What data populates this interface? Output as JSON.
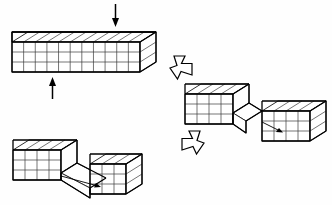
{
  "figure": {
    "background_color": "#fefefe",
    "line_color": "#000000",
    "face_color": "#ffffff",
    "grid_color": "#3a3a3a"
  },
  "shapes": [
    {
      "id": "straight-bar",
      "label": "straight-cube-bar",
      "position": "top-left",
      "front_columns": 11,
      "front_rows": 3,
      "top_columns": 11,
      "top_rows": 1,
      "side_rows": 3,
      "side_columns": 1,
      "description": "Long straight rectangular bar of unit cubes, 11 long x 3 tall x 1 deep"
    },
    {
      "id": "stepped-bar-small",
      "label": "stepped-cube-bar-small-offset",
      "position": "middle-right",
      "left_segment_columns": 4,
      "left_segment_rows": 3,
      "right_segment_columns": 4,
      "right_segment_rows": 3,
      "step_direction": "down-right",
      "description": "Bar folded once so the right half steps down by a small offset"
    },
    {
      "id": "stepped-bar-large",
      "label": "stepped-cube-bar-large-offset",
      "position": "bottom-left",
      "left_segment_columns": 4,
      "left_segment_rows": 3,
      "right_segment_columns": 3,
      "right_segment_rows": 3,
      "step_direction": "down-right",
      "description": "Bar folded once so the right half steps down by a larger offset"
    }
  ],
  "annotations": {
    "force_arrow_down": {
      "name": "downward-force-arrow",
      "direction": "down",
      "target": "straight-bar-top"
    },
    "force_arrow_up": {
      "name": "upward-force-arrow",
      "direction": "up",
      "target": "straight-bar-bottom"
    },
    "flow_arrow_1": {
      "name": "block-arrow-down-right",
      "direction": "down-right",
      "from": "straight-bar",
      "to": "stepped-bar-small"
    },
    "flow_arrow_2": {
      "name": "block-arrow-down-left",
      "direction": "down-left",
      "from": "stepped-bar-small",
      "to": "stepped-bar-large"
    }
  }
}
